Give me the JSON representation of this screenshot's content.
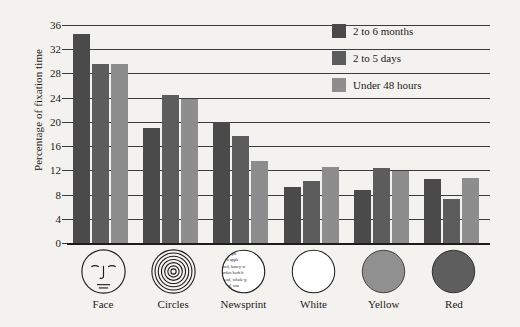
{
  "chart_data": {
    "type": "bar",
    "title": "",
    "xlabel": "",
    "ylabel": "Percentage of fixation time",
    "ylim": [
      0,
      36
    ],
    "ytick_step": 4,
    "yticks": [
      36,
      32,
      28,
      24,
      20,
      16,
      12,
      8,
      4,
      0
    ],
    "grid": true,
    "legend_position": "top-right",
    "categories": [
      "Face",
      "Circles",
      "Newsprint",
      "White",
      "Yellow",
      "Red"
    ],
    "series": [
      {
        "name": "2 to 6 months",
        "color": "#4a4a4a",
        "values": [
          34.5,
          19.0,
          20.0,
          9.2,
          8.7,
          10.5
        ]
      },
      {
        "name": "2 to 5 days",
        "color": "#5c5c5c",
        "values": [
          29.5,
          24.4,
          17.7,
          10.2,
          12.4,
          7.3
        ]
      },
      {
        "name": "Under 48 hours",
        "color": "#8d8d8d",
        "values": [
          29.5,
          23.7,
          13.5,
          12.6,
          11.9,
          10.7
        ]
      }
    ]
  },
  "icons": {
    "face": "face-icon",
    "circles": "concentric-circles-icon",
    "newsprint": "newsprint-icon",
    "white": "white-disc-icon",
    "yellow": "yellow-disc-icon",
    "red": "red-disc-icon",
    "newsprint_lines": [
      "kes apple",
      "raid, honey w",
      "arden herb b",
      "read, whole-g",
      "ead,  sun"
    ]
  },
  "colors": {
    "background": "#f4f2ee",
    "axis": "#1d1d1d",
    "grid": "#3b3b3b",
    "white_disc": "#ffffff",
    "yellow_disc": "#909090",
    "red_disc": "#5e5e5e"
  }
}
